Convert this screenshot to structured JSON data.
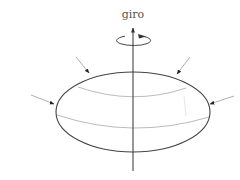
{
  "diagram": {
    "title_label": "giro",
    "colors": {
      "outline": "#444444",
      "latitude_lines": "#aaaaaa",
      "axis": "#333333",
      "arrows": "#999999",
      "arrowheads": "#222222",
      "label": "#555555"
    },
    "elements": [
      {
        "name": "rotation-axis"
      },
      {
        "name": "rotation-direction-ellipse"
      },
      {
        "name": "spheroid-outline"
      },
      {
        "name": "upper-latitude-line"
      },
      {
        "name": "equator-line"
      },
      {
        "name": "compression-arrow",
        "count": 4
      }
    ]
  }
}
